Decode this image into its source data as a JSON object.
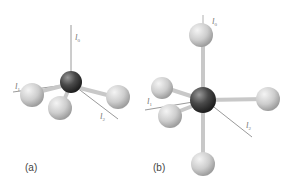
{
  "figures": [
    {
      "caption": "(a)",
      "description": "Tetrahedral molecule with central dark atom and four light atoms",
      "axes": [
        {
          "label": "l",
          "sub": "0"
        },
        {
          "label": "l",
          "sub": "1"
        },
        {
          "label": "l",
          "sub": "2"
        }
      ]
    },
    {
      "caption": "(b)",
      "description": "Octahedral molecule with central dark atom and six light atoms",
      "axes": [
        {
          "label": "l",
          "sub": "0"
        },
        {
          "label": "l",
          "sub": "1"
        },
        {
          "label": "l",
          "sub": "2"
        }
      ]
    }
  ],
  "colors": {
    "central_atom": "#4a4a4a",
    "ligand_atom": "#cfcfcf",
    "axis_line": "#8a8a8a",
    "bond": "#c8c8c8"
  }
}
